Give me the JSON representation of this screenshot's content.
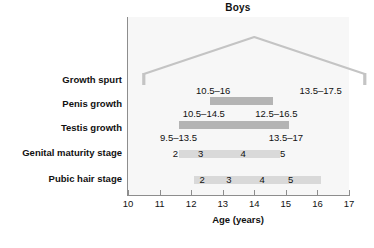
{
  "chart_data": {
    "type": "bar",
    "title": "Boys",
    "xlabel": "Age (years)",
    "ylabel": "",
    "xlim": [
      10,
      17
    ],
    "xticks": [
      10,
      11,
      12,
      13,
      14,
      15,
      16,
      17
    ],
    "xticklabels": [
      "10",
      "11",
      "12",
      "13",
      "14",
      "15",
      "16",
      "17"
    ],
    "grid": false,
    "legend": null,
    "categories": [
      "Growth spurt",
      "Penis growth",
      "Testis growth",
      "Genital maturity stage",
      "Pubic hair stage"
    ],
    "series": [
      {
        "name": "Growth spurt",
        "kind": "peak-curve",
        "start": 10.5,
        "end": 17.5,
        "peak": 14.0,
        "annotations": [
          {
            "text": "10.5–16",
            "x": 12.7
          },
          {
            "text": "13.5–17.5",
            "x": 16.1
          }
        ]
      },
      {
        "name": "Penis growth",
        "kind": "bar",
        "start": 10.5,
        "end": 16.5,
        "bar_start": 12.6,
        "bar_end": 14.6,
        "annotations": [
          {
            "text": "10.5–14.5",
            "x": 12.4
          },
          {
            "text": "12.5–16.5",
            "x": 14.7
          }
        ]
      },
      {
        "name": "Testis growth",
        "kind": "bar",
        "start": 9.5,
        "end": 17.0,
        "bar_start": 11.6,
        "bar_end": 15.1,
        "annotations": [
          {
            "text": "9.5–13.5",
            "x": 11.6
          },
          {
            "text": "13.5–17",
            "x": 15.0
          }
        ]
      },
      {
        "name": "Genital maturity stage",
        "kind": "stage-bar",
        "bar_start": 11.6,
        "bar_end": 14.8,
        "stages": [
          {
            "label": "2",
            "x": 11.5
          },
          {
            "label": "3",
            "x": 12.3
          },
          {
            "label": "4",
            "x": 13.65
          },
          {
            "label": "5",
            "x": 14.9
          }
        ]
      },
      {
        "name": "Pubic hair stage",
        "kind": "stage-bar",
        "bar_start": 12.1,
        "bar_end": 16.1,
        "stages": [
          {
            "label": "2",
            "x": 12.35
          },
          {
            "label": "3",
            "x": 13.2
          },
          {
            "label": "4",
            "x": 14.25
          },
          {
            "label": "5",
            "x": 15.15
          }
        ]
      }
    ],
    "colors": {
      "bar_dark": "#b4b4b4",
      "bar_light": "#d9d9d9",
      "panel_background": "#f7f7f7",
      "axis": "#8d8d8d",
      "text": "#111111"
    }
  },
  "labels": {
    "title": "Boys",
    "xlabel": "Age (years)",
    "rows": [
      "Growth spurt",
      "Penis growth",
      "Testis growth",
      "Genital maturity stage",
      "Pubic hair stage"
    ],
    "ticks": [
      "10",
      "11",
      "12",
      "13",
      "14",
      "15",
      "16",
      "17"
    ],
    "annotations": {
      "growth_spurt_left": "10.5–16",
      "growth_spurt_right": "13.5–17.5",
      "penis_left": "10.5–14.5",
      "penis_right": "12.5–16.5",
      "testis_left": "9.5–13.5",
      "testis_right": "13.5–17"
    },
    "genital_stages": [
      "2",
      "3",
      "4",
      "5"
    ],
    "pubic_stages": [
      "2",
      "3",
      "4",
      "5"
    ]
  }
}
